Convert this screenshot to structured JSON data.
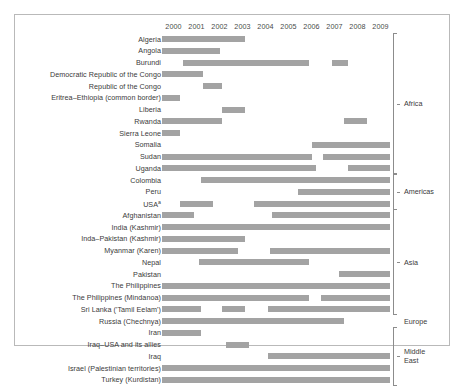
{
  "chart_data": {
    "type": "bar",
    "subtype": "gantt-timeline",
    "title": "",
    "xlabel": "",
    "ylabel": "",
    "xlim": [
      2000,
      2010
    ],
    "grid": false,
    "legend": "none",
    "bar_color": "#a3a3a3",
    "tick_labels": [
      "2000",
      "2001",
      "2002",
      "2003",
      "2004",
      "2005",
      "2006",
      "2007",
      "2008",
      "2009"
    ],
    "ticks": [
      2000,
      2001,
      2002,
      2003,
      2004,
      2005,
      2006,
      2007,
      2008,
      2009
    ],
    "region_groups": [
      {
        "name": "Africa",
        "first_row": 0,
        "last_row": 11
      },
      {
        "name": "Americas",
        "first_row": 12,
        "last_row": 14
      },
      {
        "name": "Asia",
        "first_row": 15,
        "last_row": 23
      },
      {
        "name": "Europe",
        "first_row": 24,
        "last_row": 24
      },
      {
        "name": "Middle\nEast",
        "first_row": 25,
        "last_row": 29
      }
    ],
    "categories": [
      "Algeria",
      "Angola",
      "Burundi",
      "Democratic Republic of the Congo",
      "Republic of the Congo",
      "Eritrea–Ethiopia (common border)",
      "Liberia",
      "Rwanda",
      "Sierra Leone",
      "Somalia",
      "Sudan",
      "Uganda",
      "Colombia",
      "Peru",
      "USA",
      "Afghanistan",
      "India (Kashmir)",
      "Inda–Pakistan (Kashmir)",
      "Myanmar (Karen)",
      "Nepal",
      "Pakistan",
      "The Philippines",
      "The Philippines (Mindanoa)",
      "Sri Lanka ('Tamil Eelam')",
      "Russia (Chechnya)",
      "Iran",
      "Iraq–USA and its allies",
      "Iraq",
      "Israel (Palestinian territories)",
      "Turkey (Kurdistan)"
    ],
    "category_footnotes": {
      "14": "a"
    },
    "rows": [
      {
        "label": "Algeria",
        "spans": [
          [
            2000.0,
            2003.6
          ]
        ]
      },
      {
        "label": "Angola",
        "spans": [
          [
            2000.0,
            2002.5
          ]
        ]
      },
      {
        "label": "Burundi",
        "spans": [
          [
            2000.9,
            2006.4
          ],
          [
            2007.4,
            2008.1
          ]
        ]
      },
      {
        "label": "Democratic Republic of the Congo",
        "spans": [
          [
            2000.0,
            2001.8
          ]
        ]
      },
      {
        "label": "Republic of the Congo",
        "spans": [
          [
            2001.8,
            2002.6
          ]
        ]
      },
      {
        "label": "Eritrea–Ethiopia (common border)",
        "spans": [
          [
            2000.0,
            2000.8
          ]
        ]
      },
      {
        "label": "Liberia",
        "spans": [
          [
            2002.6,
            2003.6
          ]
        ]
      },
      {
        "label": "Rwanda",
        "spans": [
          [
            2000.0,
            2002.6
          ],
          [
            2007.9,
            2008.9
          ]
        ]
      },
      {
        "label": "Sierra Leone",
        "spans": [
          [
            2000.0,
            2000.8
          ]
        ]
      },
      {
        "label": "Somalia",
        "spans": [
          [
            2006.5,
            2009.9
          ]
        ]
      },
      {
        "label": "Sudan",
        "spans": [
          [
            2000.0,
            2006.5
          ],
          [
            2007.0,
            2009.9
          ]
        ]
      },
      {
        "label": "Uganda",
        "spans": [
          [
            2000.0,
            2006.7
          ],
          [
            2008.1,
            2009.9
          ]
        ]
      },
      {
        "label": "Colombia",
        "spans": [
          [
            2001.7,
            2009.9
          ]
        ]
      },
      {
        "label": "Peru",
        "spans": [
          [
            2005.9,
            2009.9
          ]
        ]
      },
      {
        "label": "USA",
        "spans": [
          [
            2000.8,
            2002.2
          ],
          [
            2004.0,
            2009.9
          ]
        ]
      },
      {
        "label": "Afghanistan",
        "spans": [
          [
            2000.0,
            2001.4
          ],
          [
            2004.8,
            2009.9
          ]
        ]
      },
      {
        "label": "India (Kashmir)",
        "spans": [
          [
            2000.0,
            2009.9
          ]
        ]
      },
      {
        "label": "Inda–Pakistan (Kashmir)",
        "spans": [
          [
            2000.0,
            2003.6
          ]
        ]
      },
      {
        "label": "Myanmar (Karen)",
        "spans": [
          [
            2000.0,
            2003.3
          ],
          [
            2004.7,
            2009.9
          ]
        ]
      },
      {
        "label": "Nepal",
        "spans": [
          [
            2001.6,
            2006.4
          ]
        ]
      },
      {
        "label": "Pakistan",
        "spans": [
          [
            2007.7,
            2009.9
          ]
        ]
      },
      {
        "label": "The Philippines",
        "spans": [
          [
            2000.0,
            2009.9
          ]
        ]
      },
      {
        "label": "The Philippines (Mindanoa)",
        "spans": [
          [
            2000.0,
            2006.4
          ],
          [
            2006.9,
            2009.9
          ]
        ]
      },
      {
        "label": "Sri Lanka ('Tamil Eelam')",
        "spans": [
          [
            2000.0,
            2001.7
          ],
          [
            2002.6,
            2003.6
          ],
          [
            2004.6,
            2009.9
          ]
        ]
      },
      {
        "label": "Russia (Chechnya)",
        "spans": [
          [
            2000.0,
            2007.9
          ]
        ]
      },
      {
        "label": "Iran",
        "spans": [
          [
            2000.0,
            2001.7
          ]
        ]
      },
      {
        "label": "Iraq–USA and its allies",
        "spans": [
          [
            2002.8,
            2003.8
          ]
        ]
      },
      {
        "label": "Iraq",
        "spans": [
          [
            2004.6,
            2009.9
          ]
        ]
      },
      {
        "label": "Israel (Palestinian territories)",
        "spans": [
          [
            2000.0,
            2009.9
          ]
        ]
      },
      {
        "label": "Turkey (Kurdistan)",
        "spans": [
          [
            2000.0,
            2009.9
          ]
        ]
      }
    ]
  }
}
